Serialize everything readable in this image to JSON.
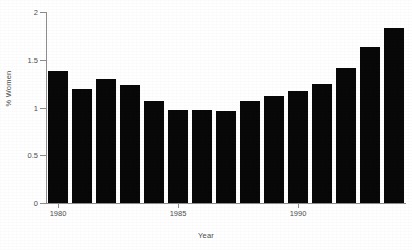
{
  "chart_data": {
    "type": "bar",
    "title": "",
    "subtitle": "",
    "xlabel": "Year",
    "ylabel": "% Women",
    "categories": [
      1980,
      1981,
      1982,
      1983,
      1984,
      1985,
      1986,
      1987,
      1988,
      1989,
      1990,
      1991,
      1992,
      1993,
      1994
    ],
    "values": [
      1.38,
      1.19,
      1.3,
      1.24,
      1.07,
      0.97,
      0.97,
      0.96,
      1.07,
      1.12,
      1.17,
      1.25,
      1.41,
      1.63,
      1.83
    ],
    "series": [
      {
        "name": "% Women",
        "values": [
          1.38,
          1.19,
          1.3,
          1.24,
          1.07,
          0.97,
          0.97,
          0.96,
          1.07,
          1.12,
          1.17,
          1.25,
          1.41,
          1.63,
          1.83
        ]
      }
    ],
    "ylim": [
      0,
      2
    ],
    "xlim": [
      1979.5,
      1994.5
    ],
    "yticks": [
      0,
      0.5,
      1,
      1.5,
      2
    ],
    "ytick_labels": [
      "0",
      "0.5",
      "1",
      "1.5",
      "2"
    ],
    "xticks": [
      1980,
      1985,
      1990
    ],
    "xtick_labels": [
      "1980",
      "1985",
      "1990"
    ],
    "grid": false,
    "legend": false,
    "legend_position": "none",
    "bar_color": "#080808",
    "axis_color": "#8c8c8c",
    "text_color": "#4d4d4d",
    "background_color": "#ffffff",
    "annotations": []
  }
}
